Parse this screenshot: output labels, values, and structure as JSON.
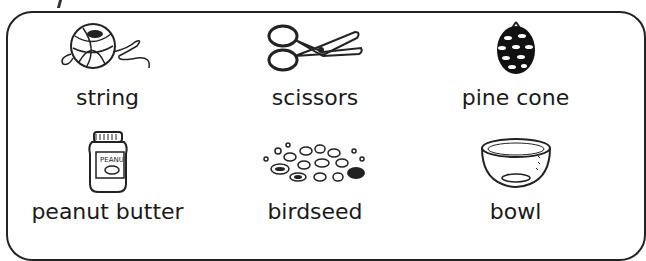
{
  "items": [
    {
      "label": "string",
      "icon": "ball-of-string-icon"
    },
    {
      "label": "scissors",
      "icon": "scissors-icon"
    },
    {
      "label": "pine cone",
      "icon": "pine-cone-icon"
    },
    {
      "label": "peanut butter",
      "icon": "peanut-butter-jar-icon",
      "jar_text": "PEANU"
    },
    {
      "label": "birdseed",
      "icon": "birdseed-icon"
    },
    {
      "label": "bowl",
      "icon": "bowl-icon"
    }
  ]
}
